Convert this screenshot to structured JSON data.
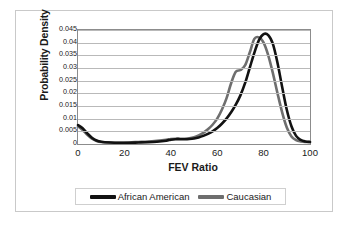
{
  "chart_data": {
    "type": "line",
    "title": "",
    "xlabel": "FEV Ratio",
    "ylabel": "Probability Density",
    "xlim": [
      0,
      100
    ],
    "ylim": [
      0,
      0.045
    ],
    "grid": "horizontal",
    "legend_position": "bottom",
    "xticks": [
      "0",
      "20",
      "40",
      "60",
      "80",
      "100"
    ],
    "yticks": [
      "0",
      "0.005",
      "0.01",
      "0.015",
      "0.02",
      "0.025",
      "0.03",
      "0.035",
      "0.04",
      "0.045"
    ],
    "x": [
      0,
      2,
      4,
      6,
      8,
      10,
      14,
      18,
      22,
      26,
      30,
      34,
      38,
      40,
      42,
      44,
      46,
      48,
      50,
      52,
      54,
      56,
      58,
      60,
      62,
      64,
      66,
      68,
      70,
      72,
      74,
      76,
      78,
      80,
      82,
      84,
      86,
      88,
      90,
      92,
      94,
      96,
      98,
      100
    ],
    "series": [
      {
        "name": "African American",
        "color": "#121212",
        "values": [
          0.0075,
          0.0062,
          0.0042,
          0.0025,
          0.0014,
          0.0009,
          0.0006,
          0.0005,
          0.0005,
          0.0006,
          0.0007,
          0.0009,
          0.0013,
          0.0017,
          0.0019,
          0.0019,
          0.0019,
          0.002,
          0.0022,
          0.0026,
          0.0032,
          0.004,
          0.005,
          0.0063,
          0.008,
          0.01,
          0.0125,
          0.0155,
          0.0192,
          0.024,
          0.03,
          0.036,
          0.041,
          0.0434,
          0.043,
          0.0395,
          0.032,
          0.0225,
          0.0135,
          0.007,
          0.0032,
          0.0016,
          0.001,
          0.0008
        ]
      },
      {
        "name": "Caucasian",
        "color": "#6e6e6e",
        "values": [
          0.007,
          0.0055,
          0.0036,
          0.0021,
          0.0012,
          0.0008,
          0.0006,
          0.0005,
          0.0006,
          0.0008,
          0.001,
          0.0013,
          0.0017,
          0.002,
          0.0021,
          0.0021,
          0.0021,
          0.0023,
          0.0027,
          0.0034,
          0.0044,
          0.0058,
          0.0076,
          0.01,
          0.0135,
          0.018,
          0.024,
          0.0285,
          0.0292,
          0.031,
          0.036,
          0.0415,
          0.0421,
          0.04,
          0.035,
          0.028,
          0.02,
          0.0125,
          0.0065,
          0.003,
          0.0015,
          0.001,
          0.0008,
          0.0008
        ]
      }
    ]
  },
  "legend": {
    "entries": [
      {
        "label": "African American",
        "color": "#121212"
      },
      {
        "label": "Caucasian",
        "color": "#6e6e6e"
      }
    ]
  }
}
